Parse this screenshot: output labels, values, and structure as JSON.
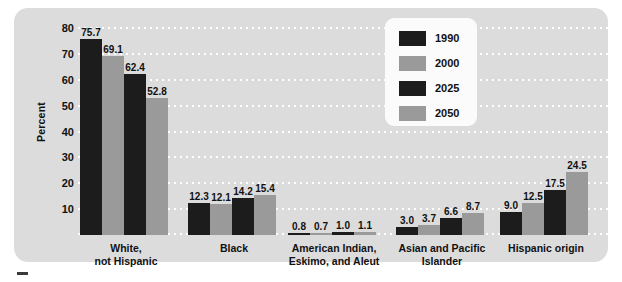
{
  "chart_data": {
    "type": "bar",
    "title": "",
    "xlabel": "",
    "ylabel": "Percent",
    "ylim": [
      0,
      80
    ],
    "grid": true,
    "legend_position": "top-right",
    "y_ticks": [
      "80",
      "70",
      "60",
      "50",
      "40",
      "30",
      "20",
      "10"
    ],
    "categories": [
      "White,\nnot Hispanic",
      "Black",
      "American Indian,\nEskimo, and Aleut",
      "Asian and Pacific\nIslander",
      "Hispanic origin"
    ],
    "series": [
      {
        "name": "1990",
        "color": "#1c1c1c",
        "values": [
          75.7,
          12.3,
          0.8,
          3.0,
          9.0
        ]
      },
      {
        "name": "2000",
        "color": "#9a9a9a",
        "values": [
          69.1,
          12.1,
          0.7,
          3.7,
          12.5
        ]
      },
      {
        "name": "2025",
        "color": "#1c1c1c",
        "values": [
          62.4,
          14.2,
          1.0,
          6.6,
          17.5
        ]
      },
      {
        "name": "2050",
        "color": "#9a9a9a",
        "values": [
          52.8,
          15.4,
          1.1,
          8.7,
          24.5
        ]
      }
    ],
    "value_labels": [
      [
        "75.7",
        "69.1",
        "62.4",
        "52.8"
      ],
      [
        "12.3",
        "12.1",
        "14.2",
        "15.4"
      ],
      [
        "0.8",
        "0.7",
        "1.0",
        "1.1"
      ],
      [
        "3.0",
        "3.7",
        "6.6",
        "8.7"
      ],
      [
        "9.0",
        "12.5",
        "17.5",
        "24.5"
      ]
    ]
  },
  "legend": {
    "items": [
      {
        "label": "1990",
        "tone": "dark"
      },
      {
        "label": "2000",
        "tone": "light"
      },
      {
        "label": "2025",
        "tone": "dark"
      },
      {
        "label": "2050",
        "tone": "light"
      }
    ]
  },
  "colors": {
    "panel_background": "#dcdcdc",
    "dark_bar": "#1c1c1c",
    "light_bar": "#9a9a9a",
    "gridline": "#ffffff",
    "legend_background": "#fbfbfb",
    "text": "#111111"
  }
}
